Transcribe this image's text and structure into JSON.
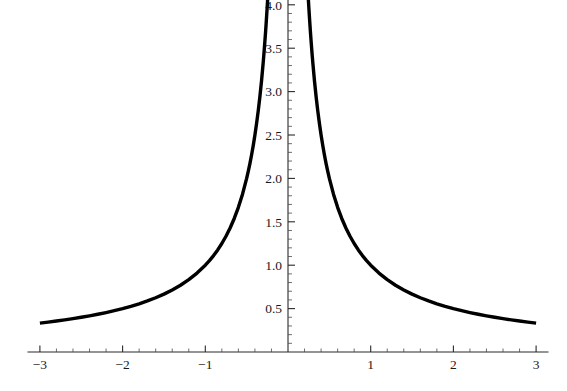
{
  "chart_data": {
    "type": "line",
    "title": "",
    "subtitle": "",
    "xlabel": "",
    "ylabel": "",
    "function": "y = 1/|x|",
    "xlim": [
      -3.15,
      3.15
    ],
    "ylim": [
      0,
      4.18
    ],
    "xticks": [
      -3,
      -2,
      -1,
      1,
      2,
      3
    ],
    "xtick_labels": [
      "-3",
      "-2",
      "-1",
      "1",
      "2",
      "3"
    ],
    "yticks": [
      0.5,
      1.0,
      1.5,
      2.0,
      2.5,
      3.0,
      3.5,
      4.0
    ],
    "ytick_labels": [
      "0.5",
      "1.0",
      "1.5",
      "2.0",
      "2.5",
      "3.0",
      "3.5",
      "4.0"
    ],
    "x_minor_step": 0.2,
    "y_minor_step": 0.1,
    "grid": false,
    "legend": null,
    "legend_position": "none",
    "axis_color": "#2a2a2a",
    "curve_color": "#000000",
    "background_color": "#ffffff",
    "series": [
      {
        "name": "left-branch",
        "x": [
          -3.0,
          -2.9,
          -2.8,
          -2.7,
          -2.6,
          -2.5,
          -2.4,
          -2.3,
          -2.2,
          -2.1,
          -2.0,
          -1.9,
          -1.8,
          -1.7,
          -1.6,
          -1.5,
          -1.4,
          -1.3,
          -1.2,
          -1.1,
          -1.0,
          -0.95,
          -0.9,
          -0.85,
          -0.8,
          -0.75,
          -0.7,
          -0.65,
          -0.6,
          -0.55,
          -0.5,
          -0.48,
          -0.46,
          -0.44,
          -0.42,
          -0.4,
          -0.38,
          -0.36,
          -0.34,
          -0.32,
          -0.3,
          -0.29,
          -0.28,
          -0.27,
          -0.262,
          -0.2525,
          -0.245
        ],
        "values": [
          0.3333,
          0.3448,
          0.3571,
          0.3704,
          0.3846,
          0.4,
          0.4167,
          0.4348,
          0.4545,
          0.4762,
          0.5,
          0.5263,
          0.5556,
          0.5882,
          0.625,
          0.6667,
          0.7143,
          0.7692,
          0.8333,
          0.9091,
          1.0,
          1.0526,
          1.1111,
          1.1765,
          1.25,
          1.3333,
          1.4286,
          1.5385,
          1.6667,
          1.8182,
          2.0,
          2.0833,
          2.1739,
          2.2727,
          2.381,
          2.5,
          2.6316,
          2.7778,
          2.9412,
          3.125,
          3.3333,
          3.4483,
          3.5714,
          3.7037,
          3.8168,
          3.9604,
          4.0816
        ]
      },
      {
        "name": "right-branch",
        "x": [
          0.245,
          0.2525,
          0.262,
          0.27,
          0.28,
          0.29,
          0.3,
          0.32,
          0.34,
          0.36,
          0.38,
          0.4,
          0.42,
          0.44,
          0.46,
          0.48,
          0.5,
          0.55,
          0.6,
          0.65,
          0.7,
          0.75,
          0.8,
          0.85,
          0.9,
          0.95,
          1.0,
          1.1,
          1.2,
          1.3,
          1.4,
          1.5,
          1.6,
          1.7,
          1.8,
          1.9,
          2.0,
          2.1,
          2.2,
          2.3,
          2.4,
          2.5,
          2.6,
          2.7,
          2.8,
          2.9,
          3.0
        ],
        "values": [
          4.0816,
          3.9604,
          3.8168,
          3.7037,
          3.5714,
          3.4483,
          3.3333,
          3.125,
          2.9412,
          2.7778,
          2.6316,
          2.5,
          2.381,
          2.2727,
          2.1739,
          2.0833,
          2.0,
          1.8182,
          1.6667,
          1.5385,
          1.4286,
          1.3333,
          1.25,
          1.1765,
          1.1111,
          1.0526,
          1.0,
          0.9091,
          0.8333,
          0.7692,
          0.7143,
          0.6667,
          0.625,
          0.5882,
          0.5556,
          0.5263,
          0.5,
          0.4762,
          0.4545,
          0.4348,
          0.4167,
          0.4,
          0.3846,
          0.3704,
          0.3571,
          0.3448,
          0.3333
        ]
      }
    ]
  },
  "figure": {
    "alt": "Plot of y = 1 over absolute value of x on the interval negative three to three"
  }
}
